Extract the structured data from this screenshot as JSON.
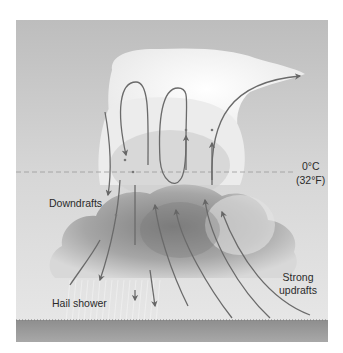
{
  "diagram": {
    "colors": {
      "sky_top": "#bcbcbc",
      "sky_bottom": "#e4e4e4",
      "cloud_light": "#f6f6f6",
      "cloud_dark": "#8a8a8a",
      "ground": "#9a9a9a",
      "arrow": "#6a6a6a",
      "text": "#2a2a2a"
    },
    "freezing_level": {
      "line1": "0°C",
      "line2": "(32°F)"
    },
    "labels": {
      "downdrafts": "Downdrafts",
      "hail_shower": "Hail shower",
      "strong_line1": "Strong",
      "strong_line2": "updrafts"
    }
  }
}
